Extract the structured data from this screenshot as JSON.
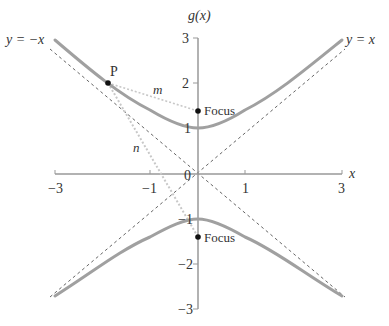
{
  "figure": {
    "title": "g(x)",
    "x_axis_label": "x",
    "y_axis_label": "g(x)",
    "x_ticks": [
      {
        "value": -3,
        "label": "−3"
      },
      {
        "value": -1,
        "label": "−1"
      },
      {
        "value": 1,
        "label": "1"
      },
      {
        "value": 3,
        "label": "3"
      }
    ],
    "y_ticks": [
      {
        "value": 3,
        "label": "3"
      },
      {
        "value": 2,
        "label": "2"
      },
      {
        "value": 1,
        "label": "1"
      },
      {
        "value": -1,
        "label": "−1"
      },
      {
        "value": -2,
        "label": "−2"
      },
      {
        "value": -3,
        "label": "−3"
      }
    ],
    "origin_label": "0",
    "asymptotes": [
      {
        "label": "y = −x",
        "slope": -1
      },
      {
        "label": "y = x",
        "slope": 1
      }
    ],
    "curve": {
      "equation": "y² − x² = 1",
      "color": "#999999"
    },
    "points": [
      {
        "label": "P",
        "x": -1.73,
        "y": 2.0
      },
      {
        "label": "Focus",
        "x": 0,
        "y": 1.41
      },
      {
        "label": "Focus",
        "x": 0,
        "y": -1.41
      }
    ],
    "segments": [
      {
        "label": "m",
        "from": "P",
        "to": "upper focus"
      },
      {
        "label": "n",
        "from": "P",
        "to": "lower focus"
      }
    ],
    "colors": {
      "axis": "#999999",
      "curve": "#a0a0a0",
      "asymptote": "#666666",
      "segment": "#c8c8c8",
      "text": "#333333",
      "point": "#111111"
    }
  }
}
